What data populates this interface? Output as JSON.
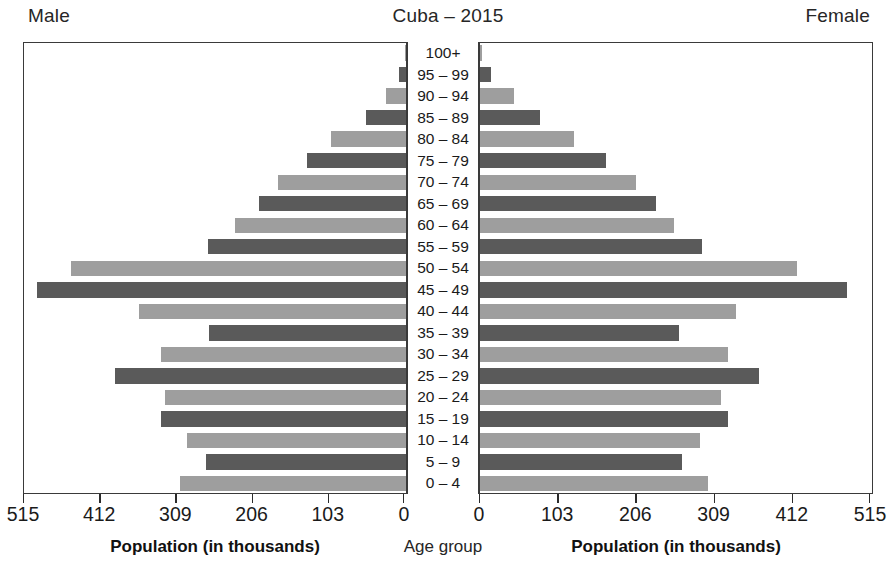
{
  "header": {
    "left_label": "Male",
    "title": "Cuba – 2015",
    "right_label": "Female"
  },
  "footer": {
    "male_axis_caption": "Population (in thousands)",
    "center_caption": "Age group",
    "female_axis_caption": "Population (in thousands)"
  },
  "axes": {
    "male_ticks": [
      "515",
      "412",
      "309",
      "206",
      "103",
      "0"
    ],
    "female_ticks": [
      "0",
      "103",
      "206",
      "309",
      "412",
      "515"
    ],
    "max": 515,
    "min": 0
  },
  "colors": {
    "bar_dark": "#5a5a5a",
    "bar_light": "#9e9e9e",
    "border": "#3a3a3a",
    "text": "#1a1a1a",
    "background": "#ffffff"
  },
  "chart_data": {
    "type": "bar",
    "title": "Cuba – 2015",
    "subtitle": "",
    "orientation": "horizontal-diverging-population-pyramid",
    "xlabel": "Population (in thousands)",
    "ylabel": "Age group",
    "xlim": [
      0,
      515
    ],
    "grid": false,
    "legend": [
      "Male",
      "Female"
    ],
    "legend_position": "top-left and top-right",
    "categories": [
      "100+",
      "95 – 99",
      "90 – 94",
      "85 – 89",
      "80 – 84",
      "75 – 79",
      "70 – 74",
      "65 – 69",
      "60 – 64",
      "55 – 59",
      "50 – 54",
      "45 – 49",
      "40 – 44",
      "35 – 39",
      "30 – 34",
      "25 – 29",
      "20 – 24",
      "15 – 19",
      "10 – 14",
      "5 – 9",
      "0 – 4"
    ],
    "series": [
      {
        "name": "Male",
        "side": "left",
        "values": [
          2,
          9,
          27,
          54,
          101,
          134,
          173,
          199,
          231,
          268,
          453,
          499,
          361,
          266,
          331,
          393,
          326,
          331,
          296,
          271,
          306
        ]
      },
      {
        "name": "Female",
        "side": "right",
        "values": [
          3,
          14,
          45,
          79,
          124,
          166,
          206,
          232,
          256,
          293,
          418,
          483,
          337,
          262,
          326,
          367,
          317,
          327,
          290,
          266,
          300
        ]
      }
    ]
  }
}
